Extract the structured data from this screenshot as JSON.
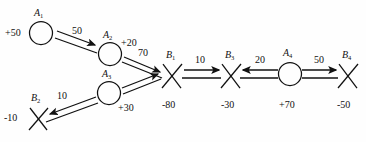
{
  "diagram": {
    "stroke_color": "#111111",
    "background_color": "#fefefe",
    "nodes": [
      {
        "id": "A1",
        "base": "A",
        "sub": "1",
        "shape": "circle",
        "value": "+50",
        "value_side": "left",
        "cx": 41,
        "cy": 33
      },
      {
        "id": "A2",
        "base": "A",
        "sub": "2",
        "shape": "circle",
        "value": "+20",
        "value_side": "right",
        "cx": 110,
        "cy": 54
      },
      {
        "id": "A3",
        "base": "A",
        "sub": "3",
        "shape": "circle",
        "value": "+30",
        "value_side": "right-bottom",
        "cx": 109,
        "cy": 93
      },
      {
        "id": "A4",
        "base": "A",
        "sub": "4",
        "shape": "circle",
        "value": "+70",
        "value_side": "bottom",
        "cx": 290,
        "cy": 74
      },
      {
        "id": "B1",
        "base": "B",
        "sub": "1",
        "shape": "cross",
        "value": "-80",
        "value_side": "bottom",
        "cx": 172,
        "cy": 76
      },
      {
        "id": "B2",
        "base": "B",
        "sub": "2",
        "shape": "cross",
        "value": "-10",
        "value_side": "left",
        "cx": 38,
        "cy": 118
      },
      {
        "id": "B3",
        "base": "B",
        "sub": "3",
        "shape": "cross",
        "value": "-30",
        "value_side": "bottom",
        "cx": 231,
        "cy": 76
      },
      {
        "id": "B4",
        "base": "B",
        "sub": "4",
        "shape": "cross",
        "value": "-50",
        "value_side": "bottom",
        "cx": 348,
        "cy": 76
      }
    ],
    "edges": [
      {
        "from": "A1",
        "to": "A2",
        "cost": "50",
        "label_x": 80,
        "label_y": 33
      },
      {
        "from": "A2",
        "to": "B1",
        "cost": "70",
        "label_x": 142,
        "label_y": 57
      },
      {
        "from": "A3",
        "to": "B1",
        "cost": "",
        "label_x": 0,
        "label_y": 0
      },
      {
        "from": "A3",
        "to": "B2",
        "cost": "10",
        "label_x": 62,
        "label_y": 98
      },
      {
        "from": "B1",
        "to": "B3",
        "cost": "10",
        "label_x": 199,
        "label_y": 63
      },
      {
        "from": "A4",
        "to": "B3",
        "cost": "20",
        "label_x": 262,
        "label_y": 61
      },
      {
        "from": "A4",
        "to": "B4",
        "cost": "50",
        "label_x": 321,
        "label_y": 61
      }
    ]
  }
}
